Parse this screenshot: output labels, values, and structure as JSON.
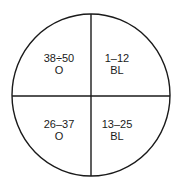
{
  "diagram": {
    "type": "quadrant-circle",
    "stroke_color": "#1a1a1a",
    "background": "#ffffff",
    "quadrants": [
      {
        "position": "top-left",
        "range": "38÷50",
        "code": "O"
      },
      {
        "position": "top-right",
        "range": "1–12",
        "code": "BL"
      },
      {
        "position": "bottom-left",
        "range": "26–37",
        "code": "O"
      },
      {
        "position": "bottom-right",
        "range": "13–25",
        "code": "BL"
      }
    ]
  }
}
